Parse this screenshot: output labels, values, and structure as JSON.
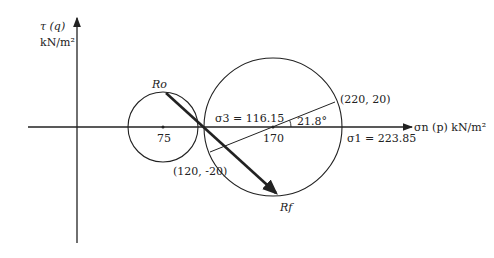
{
  "diagram": {
    "y_axis": {
      "label_line1": "τ (q)",
      "label_line2": "kN/m²"
    },
    "x_axis": {
      "label": "σn (p) kN/m²"
    },
    "small_circle": {
      "center_label": "75",
      "top_point_label": "Ro"
    },
    "large_circle": {
      "center_label": "170",
      "sigma3_label": "σ3 = 116.15",
      "sigma1_label": "σ1 = 223.85",
      "angle_label": "21.8°",
      "point_upper_label": "(220, 20)",
      "point_lower_label": "(120, -20)",
      "bottom_point_label": "Rf"
    },
    "colors": {
      "line": "#222222",
      "background": "#ffffff"
    }
  }
}
